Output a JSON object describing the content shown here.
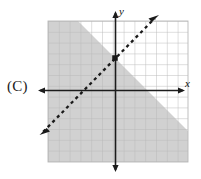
{
  "figure": {
    "choice_label": "(C)",
    "axes": {
      "x_label": "x",
      "y_label": "y",
      "x_axis_y_px": 90,
      "y_axis_x_px": 115,
      "arrowheads": [
        "left",
        "right",
        "up",
        "down"
      ]
    },
    "grid": {
      "left_px": 48,
      "top_px": 21,
      "right_px": 188,
      "bottom_px": 162,
      "cell_px": 10.8,
      "columns": 13,
      "rows": 13,
      "line_color": "#b8b8b8",
      "background_color": "#ffffff"
    },
    "boundary_line": {
      "style": "dashed",
      "color": "#1a1a1a",
      "slope": 1,
      "y_intercept_px": 58,
      "start_px": [
        40,
        135
      ],
      "end_px": [
        158,
        15
      ],
      "arrow_both_ends": true,
      "marked_point_px": [
        115,
        58
      ]
    },
    "shaded_region": {
      "side": "below-right",
      "color": "#cfcfcf",
      "description": "region below and to the right of the dashed line"
    }
  },
  "chart_data": {
    "type": "line",
    "title": "",
    "xlabel": "x",
    "ylabel": "y",
    "xlim": [
      -6,
      7
    ],
    "ylim": [
      -7,
      6
    ],
    "grid": true,
    "legend": "none",
    "series": [
      {
        "name": "boundary",
        "linestyle": "dashed",
        "slope": 1,
        "intercept": 3,
        "equation": "y = x + 3",
        "x": [
          -6,
          7
        ],
        "values": [
          -3,
          10
        ],
        "points": [
          [
            0,
            3
          ]
        ]
      }
    ],
    "annotations": [
      {
        "type": "inequality-shading",
        "region": "y < x + 3",
        "fill": "#cfcfcf"
      }
    ]
  }
}
